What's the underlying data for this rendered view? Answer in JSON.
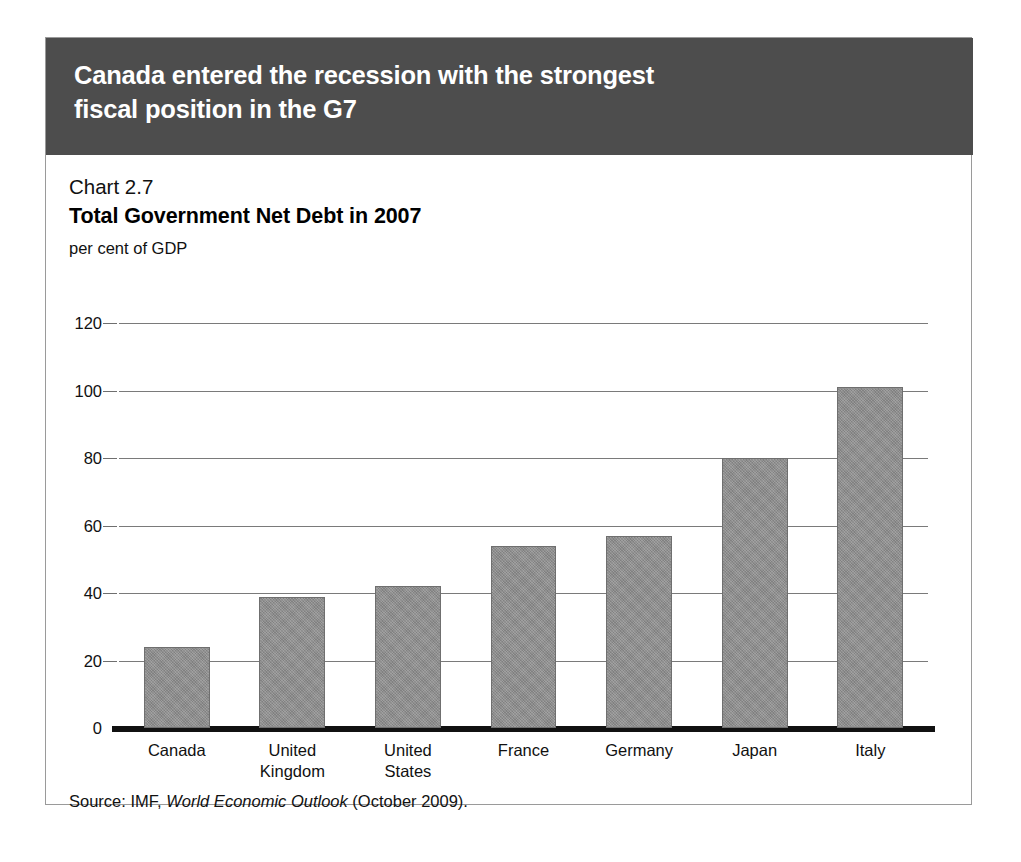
{
  "banner": {
    "title": "Canada entered the recession with the strongest\nfiscal position in the G7"
  },
  "chart_header": {
    "number": "Chart 2.7",
    "title": "Total Government Net Debt in 2007",
    "units": "per cent of GDP"
  },
  "source": {
    "prefix": "Source: IMF, ",
    "publication": "World Economic Outlook",
    "suffix": " (October 2009)."
  },
  "colors": {
    "banner_bg": "#4d4d4d",
    "bar_fill": "#8d8d8d",
    "bar_stroke": "#6f6f6f",
    "gridline": "#7a7a7a",
    "axis": "#111111",
    "card_border": "#9a9a9a"
  },
  "chart_data": {
    "type": "bar",
    "title": "Total Government Net Debt in 2007",
    "subtitle": "Chart 2.7",
    "xlabel": "",
    "ylabel": "per cent of GDP",
    "categories": [
      "Canada",
      "United\nKingdom",
      "United\nStates",
      "France",
      "Germany",
      "Japan",
      "Italy"
    ],
    "values": [
      24,
      38.8,
      42,
      54,
      57,
      80,
      101
    ],
    "ylim": [
      0,
      120
    ],
    "yticks": [
      0,
      20,
      40,
      60,
      80,
      100,
      120
    ],
    "ytick_labels": [
      "0",
      "20",
      "40",
      "60",
      "80",
      "100",
      "120"
    ],
    "grid": true,
    "legend": "none",
    "source": "Source: IMF, World Economic Outlook (October 2009)."
  }
}
